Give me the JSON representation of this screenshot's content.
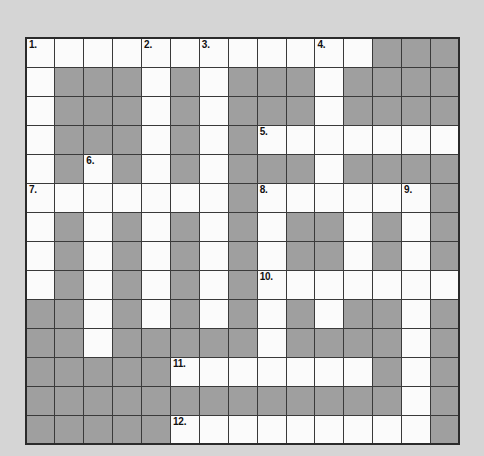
{
  "puzzle": {
    "title": "Crossword Grid",
    "rows": 13,
    "cols": 15,
    "colors": {
      "background": "#d5d5d5",
      "open_cell": "#fbfbfb",
      "blocked_cell": "#9f9f9f",
      "grid_line": "#3a3a3a",
      "border": "#2b2b2b",
      "clue_number": "#111111"
    },
    "cell_size_px": 29,
    "clue_numbers_visible": [
      "1.",
      "2.",
      "3.",
      "4.",
      "5.",
      "6.",
      "7.",
      "8.",
      "9.",
      "10.",
      "11.",
      "12."
    ],
    "grid": [
      [
        {
          "state": "open",
          "num": "1."
        },
        {
          "state": "open",
          "num": ""
        },
        {
          "state": "open",
          "num": ""
        },
        {
          "state": "open",
          "num": ""
        },
        {
          "state": "open",
          "num": "2."
        },
        {
          "state": "open",
          "num": ""
        },
        {
          "state": "open",
          "num": "3."
        },
        {
          "state": "open",
          "num": ""
        },
        {
          "state": "open",
          "num": ""
        },
        {
          "state": "open",
          "num": ""
        },
        {
          "state": "open",
          "num": "4."
        },
        {
          "state": "open",
          "num": ""
        },
        {
          "state": "block",
          "num": ""
        },
        {
          "state": "block",
          "num": ""
        },
        {
          "state": "block",
          "num": ""
        }
      ],
      [
        {
          "state": "open",
          "num": ""
        },
        {
          "state": "block",
          "num": ""
        },
        {
          "state": "block",
          "num": ""
        },
        {
          "state": "block",
          "num": ""
        },
        {
          "state": "open",
          "num": ""
        },
        {
          "state": "block",
          "num": ""
        },
        {
          "state": "open",
          "num": ""
        },
        {
          "state": "block",
          "num": ""
        },
        {
          "state": "block",
          "num": ""
        },
        {
          "state": "block",
          "num": ""
        },
        {
          "state": "open",
          "num": ""
        },
        {
          "state": "block",
          "num": ""
        },
        {
          "state": "block",
          "num": ""
        },
        {
          "state": "block",
          "num": ""
        },
        {
          "state": "block",
          "num": ""
        }
      ],
      [
        {
          "state": "open",
          "num": ""
        },
        {
          "state": "block",
          "num": ""
        },
        {
          "state": "block",
          "num": ""
        },
        {
          "state": "block",
          "num": ""
        },
        {
          "state": "open",
          "num": ""
        },
        {
          "state": "block",
          "num": ""
        },
        {
          "state": "open",
          "num": ""
        },
        {
          "state": "block",
          "num": ""
        },
        {
          "state": "block",
          "num": ""
        },
        {
          "state": "block",
          "num": ""
        },
        {
          "state": "open",
          "num": ""
        },
        {
          "state": "block",
          "num": ""
        },
        {
          "state": "block",
          "num": ""
        },
        {
          "state": "block",
          "num": ""
        },
        {
          "state": "block",
          "num": ""
        }
      ],
      [
        {
          "state": "open",
          "num": ""
        },
        {
          "state": "block",
          "num": ""
        },
        {
          "state": "block",
          "num": ""
        },
        {
          "state": "block",
          "num": ""
        },
        {
          "state": "open",
          "num": ""
        },
        {
          "state": "block",
          "num": ""
        },
        {
          "state": "open",
          "num": ""
        },
        {
          "state": "block",
          "num": ""
        },
        {
          "state": "open",
          "num": "5."
        },
        {
          "state": "open",
          "num": ""
        },
        {
          "state": "open",
          "num": ""
        },
        {
          "state": "open",
          "num": ""
        },
        {
          "state": "open",
          "num": ""
        },
        {
          "state": "open",
          "num": ""
        },
        {
          "state": "open",
          "num": ""
        }
      ],
      [
        {
          "state": "open",
          "num": ""
        },
        {
          "state": "block",
          "num": ""
        },
        {
          "state": "open",
          "num": "6."
        },
        {
          "state": "block",
          "num": ""
        },
        {
          "state": "open",
          "num": ""
        },
        {
          "state": "block",
          "num": ""
        },
        {
          "state": "open",
          "num": ""
        },
        {
          "state": "block",
          "num": ""
        },
        {
          "state": "block",
          "num": ""
        },
        {
          "state": "block",
          "num": ""
        },
        {
          "state": "open",
          "num": ""
        },
        {
          "state": "block",
          "num": ""
        },
        {
          "state": "block",
          "num": ""
        },
        {
          "state": "block",
          "num": ""
        },
        {
          "state": "block",
          "num": ""
        }
      ],
      [
        {
          "state": "open",
          "num": "7."
        },
        {
          "state": "open",
          "num": ""
        },
        {
          "state": "open",
          "num": ""
        },
        {
          "state": "open",
          "num": ""
        },
        {
          "state": "open",
          "num": ""
        },
        {
          "state": "open",
          "num": ""
        },
        {
          "state": "open",
          "num": ""
        },
        {
          "state": "block",
          "num": ""
        },
        {
          "state": "open",
          "num": "8."
        },
        {
          "state": "open",
          "num": ""
        },
        {
          "state": "open",
          "num": ""
        },
        {
          "state": "open",
          "num": ""
        },
        {
          "state": "open",
          "num": ""
        },
        {
          "state": "open",
          "num": "9."
        },
        {
          "state": "block",
          "num": ""
        }
      ],
      [
        {
          "state": "open",
          "num": ""
        },
        {
          "state": "block",
          "num": ""
        },
        {
          "state": "open",
          "num": ""
        },
        {
          "state": "block",
          "num": ""
        },
        {
          "state": "open",
          "num": ""
        },
        {
          "state": "block",
          "num": ""
        },
        {
          "state": "open",
          "num": ""
        },
        {
          "state": "block",
          "num": ""
        },
        {
          "state": "open",
          "num": ""
        },
        {
          "state": "block",
          "num": ""
        },
        {
          "state": "block",
          "num": ""
        },
        {
          "state": "open",
          "num": ""
        },
        {
          "state": "block",
          "num": ""
        },
        {
          "state": "open",
          "num": ""
        },
        {
          "state": "block",
          "num": ""
        }
      ],
      [
        {
          "state": "open",
          "num": ""
        },
        {
          "state": "block",
          "num": ""
        },
        {
          "state": "open",
          "num": ""
        },
        {
          "state": "block",
          "num": ""
        },
        {
          "state": "open",
          "num": ""
        },
        {
          "state": "block",
          "num": ""
        },
        {
          "state": "open",
          "num": ""
        },
        {
          "state": "block",
          "num": ""
        },
        {
          "state": "open",
          "num": ""
        },
        {
          "state": "block",
          "num": ""
        },
        {
          "state": "block",
          "num": ""
        },
        {
          "state": "open",
          "num": ""
        },
        {
          "state": "block",
          "num": ""
        },
        {
          "state": "open",
          "num": ""
        },
        {
          "state": "block",
          "num": ""
        }
      ],
      [
        {
          "state": "open",
          "num": ""
        },
        {
          "state": "block",
          "num": ""
        },
        {
          "state": "open",
          "num": ""
        },
        {
          "state": "block",
          "num": ""
        },
        {
          "state": "open",
          "num": ""
        },
        {
          "state": "block",
          "num": ""
        },
        {
          "state": "open",
          "num": ""
        },
        {
          "state": "block",
          "num": ""
        },
        {
          "state": "open",
          "num": "10."
        },
        {
          "state": "open",
          "num": ""
        },
        {
          "state": "open",
          "num": ""
        },
        {
          "state": "open",
          "num": ""
        },
        {
          "state": "open",
          "num": ""
        },
        {
          "state": "open",
          "num": ""
        },
        {
          "state": "open",
          "num": ""
        }
      ],
      [
        {
          "state": "block",
          "num": ""
        },
        {
          "state": "block",
          "num": ""
        },
        {
          "state": "open",
          "num": ""
        },
        {
          "state": "block",
          "num": ""
        },
        {
          "state": "open",
          "num": ""
        },
        {
          "state": "block",
          "num": ""
        },
        {
          "state": "open",
          "num": ""
        },
        {
          "state": "block",
          "num": ""
        },
        {
          "state": "open",
          "num": ""
        },
        {
          "state": "block",
          "num": ""
        },
        {
          "state": "open",
          "num": ""
        },
        {
          "state": "block",
          "num": ""
        },
        {
          "state": "block",
          "num": ""
        },
        {
          "state": "open",
          "num": ""
        },
        {
          "state": "block",
          "num": ""
        }
      ],
      [
        {
          "state": "block",
          "num": ""
        },
        {
          "state": "block",
          "num": ""
        },
        {
          "state": "open",
          "num": ""
        },
        {
          "state": "block",
          "num": ""
        },
        {
          "state": "block",
          "num": ""
        },
        {
          "state": "block",
          "num": ""
        },
        {
          "state": "block",
          "num": ""
        },
        {
          "state": "block",
          "num": ""
        },
        {
          "state": "open",
          "num": ""
        },
        {
          "state": "block",
          "num": ""
        },
        {
          "state": "block",
          "num": ""
        },
        {
          "state": "block",
          "num": ""
        },
        {
          "state": "block",
          "num": ""
        },
        {
          "state": "open",
          "num": ""
        },
        {
          "state": "block",
          "num": ""
        }
      ],
      [
        {
          "state": "block",
          "num": ""
        },
        {
          "state": "block",
          "num": ""
        },
        {
          "state": "block",
          "num": ""
        },
        {
          "state": "block",
          "num": ""
        },
        {
          "state": "block",
          "num": ""
        },
        {
          "state": "open",
          "num": "11."
        },
        {
          "state": "open",
          "num": ""
        },
        {
          "state": "open",
          "num": ""
        },
        {
          "state": "open",
          "num": ""
        },
        {
          "state": "open",
          "num": ""
        },
        {
          "state": "open",
          "num": ""
        },
        {
          "state": "open",
          "num": ""
        },
        {
          "state": "block",
          "num": ""
        },
        {
          "state": "open",
          "num": ""
        },
        {
          "state": "block",
          "num": ""
        }
      ],
      [
        {
          "state": "block",
          "num": ""
        },
        {
          "state": "block",
          "num": ""
        },
        {
          "state": "block",
          "num": ""
        },
        {
          "state": "block",
          "num": ""
        },
        {
          "state": "block",
          "num": ""
        },
        {
          "state": "block",
          "num": ""
        },
        {
          "state": "block",
          "num": ""
        },
        {
          "state": "block",
          "num": ""
        },
        {
          "state": "block",
          "num": ""
        },
        {
          "state": "block",
          "num": ""
        },
        {
          "state": "block",
          "num": ""
        },
        {
          "state": "block",
          "num": ""
        },
        {
          "state": "block",
          "num": ""
        },
        {
          "state": "open",
          "num": ""
        },
        {
          "state": "block",
          "num": ""
        }
      ],
      [
        {
          "state": "block",
          "num": ""
        },
        {
          "state": "block",
          "num": ""
        },
        {
          "state": "block",
          "num": ""
        },
        {
          "state": "block",
          "num": ""
        },
        {
          "state": "block",
          "num": ""
        },
        {
          "state": "open",
          "num": "12."
        },
        {
          "state": "open",
          "num": ""
        },
        {
          "state": "open",
          "num": ""
        },
        {
          "state": "open",
          "num": ""
        },
        {
          "state": "open",
          "num": ""
        },
        {
          "state": "open",
          "num": ""
        },
        {
          "state": "open",
          "num": ""
        },
        {
          "state": "open",
          "num": ""
        },
        {
          "state": "open",
          "num": ""
        },
        {
          "state": "block",
          "num": ""
        }
      ]
    ]
  }
}
